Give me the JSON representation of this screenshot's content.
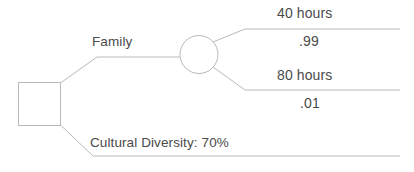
{
  "diagram": {
    "type": "decision-tree",
    "title": "",
    "nodes": {
      "decision": {
        "shape": "square",
        "label": ""
      },
      "chance": {
        "shape": "circle",
        "label": ""
      }
    },
    "branches": [
      {
        "id": "family",
        "label": "Family",
        "from": "decision",
        "to": "chance"
      },
      {
        "id": "cultural-diversity",
        "label": "Cultural Diversity: 70%",
        "from": "decision",
        "to": "terminal"
      }
    ],
    "outcomes": [
      {
        "id": "outcome-40-hours",
        "label": "40 hours",
        "probability": ".99",
        "from": "chance"
      },
      {
        "id": "outcome-80-hours",
        "label": "80 hours",
        "probability": ".01",
        "from": "chance"
      }
    ],
    "colors": {
      "line": "#b9b9b9",
      "text": "#4a4a4a",
      "background": "#ffffff"
    }
  }
}
